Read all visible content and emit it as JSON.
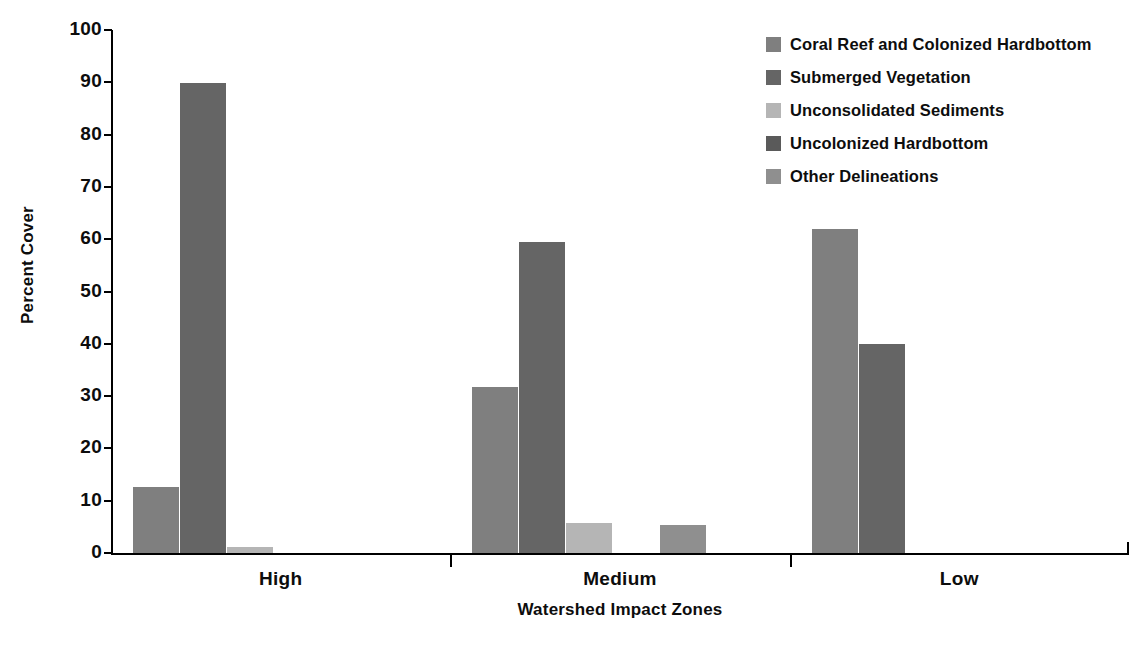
{
  "chart_data": {
    "type": "bar",
    "title": "",
    "xlabel": "Watershed Impact Zones",
    "ylabel": "Percent Cover",
    "categories": [
      "High",
      "Medium",
      "Low"
    ],
    "ylim": [
      0,
      100
    ],
    "yticks": [
      0,
      10,
      20,
      30,
      40,
      50,
      60,
      70,
      80,
      90,
      100
    ],
    "ytick_labels": [
      "0",
      "10",
      "20",
      "30",
      "40",
      "50",
      "60",
      "70",
      "80",
      "90",
      "100"
    ],
    "grid": false,
    "legend_position": "top-right",
    "series": [
      {
        "name": "Coral Reef and Colonized Hardbottom",
        "color": "#7f7f7f",
        "values": [
          12.7,
          31.8,
          62.0
        ]
      },
      {
        "name": "Submerged Vegetation",
        "color": "#656565",
        "values": [
          89.8,
          59.5,
          39.9
        ]
      },
      {
        "name": "Unconsolidated Sediments",
        "color": "#b5b5b5",
        "values": [
          1.2,
          5.8,
          0
        ]
      },
      {
        "name": "Uncolonized Hardbottom",
        "color": "#5a5a5a",
        "values": [
          0,
          0,
          0
        ]
      },
      {
        "name": "Other Delineations",
        "color": "#8f8f8f",
        "values": [
          0,
          5.3,
          0
        ]
      }
    ]
  },
  "axes": {
    "y_title": "Percent Cover",
    "x_title": "Watershed Impact Zones"
  },
  "colors": {
    "axis": "#000000",
    "text": "#0d0d0d",
    "background": "#ffffff"
  }
}
